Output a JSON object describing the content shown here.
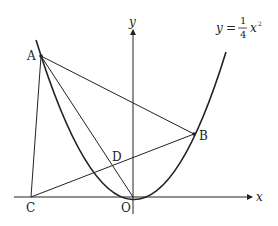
{
  "diagram": {
    "curve_label": {
      "lhs": "y",
      "eq": "=",
      "num": "1",
      "den": "4",
      "var": "x",
      "exp": "2"
    },
    "axes": {
      "x_label": "x",
      "y_label": "y",
      "origin_label": "O"
    },
    "points": [
      {
        "name": "A",
        "label": "A"
      },
      {
        "name": "B",
        "label": "B"
      },
      {
        "name": "C",
        "label": "C"
      },
      {
        "name": "D",
        "label": "D"
      },
      {
        "name": "O",
        "label": "O"
      }
    ],
    "colors": {
      "stroke": "#222222",
      "background": "#ffffff"
    }
  }
}
